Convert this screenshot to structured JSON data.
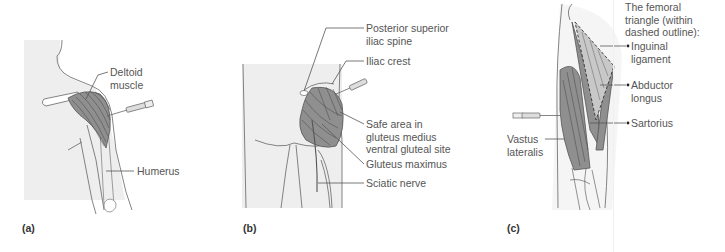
{
  "figure": {
    "panels": [
      {
        "letter": "(a)",
        "site": "deltoid",
        "labels": {
          "deltoid_line1": "Deltoid",
          "deltoid_line2": "muscle",
          "humerus": "Humerus"
        }
      },
      {
        "letter": "(b)",
        "site": "ventrogluteal",
        "labels": {
          "psis_line1": "Posterior superior",
          "psis_line2": "iliac spine",
          "iliac_crest": "Iliac crest",
          "safe_line1": "Safe area in",
          "safe_line2": "gluteus medius",
          "safe_line3": "ventral gluteal site",
          "gluteus_maximus": "Gluteus maximus",
          "sciatic_nerve": "Sciatic nerve"
        }
      },
      {
        "letter": "(c)",
        "site": "vastus-lateralis",
        "labels": {
          "title_line1": "The femoral",
          "title_line2": "triangle (within",
          "title_line3": "dashed outline):",
          "inguinal_line1": "Inguinal",
          "inguinal_line2": "ligament",
          "abductor_line1": "Abductor",
          "abductor_line2": "longus",
          "sartorius": "Sartorius",
          "vastus_line1": "Vastus",
          "vastus_line2": "lateralis"
        }
      }
    ],
    "colors": {
      "skin_fill": "#eeeeee",
      "outline": "#666666",
      "muscle_fill": "#9a9a9a",
      "muscle_stripe": "#555555",
      "leader_line": "#555555",
      "text": "#555555"
    }
  }
}
